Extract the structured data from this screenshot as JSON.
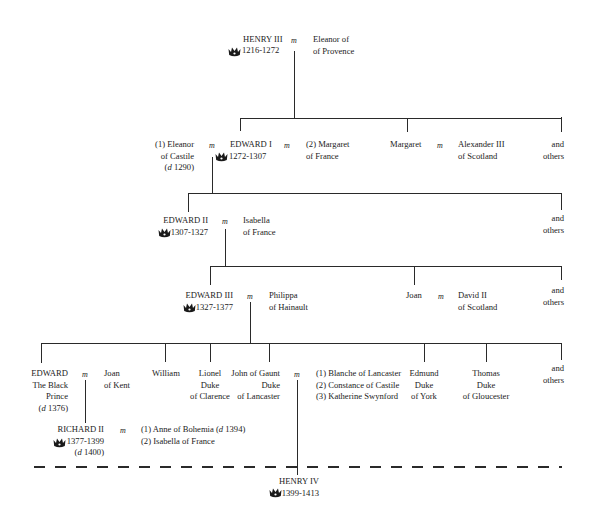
{
  "diagram": {
    "marriage_symbol": "m",
    "crown_icon": "crown-icon",
    "generation1": {
      "king": {
        "name": "HENRY III",
        "reign": "1216-1272"
      },
      "spouse": {
        "line1": "Eleanor of",
        "line2": "of Provence"
      }
    },
    "generation2": {
      "spouse1": {
        "line1": "(1) Eleanor",
        "line2": "of Castile",
        "line3_prefix": "d",
        "line3": "1290"
      },
      "king": {
        "name": "EDWARD I",
        "reign": "1272-1307"
      },
      "spouse2": {
        "line1": "(2) Margaret",
        "line2": "of France"
      },
      "sibling": {
        "name": "Margaret"
      },
      "sibling_spouse": {
        "line1": "Alexander III",
        "line2": "of Scotland"
      },
      "others": {
        "line1": "and",
        "line2": "others"
      }
    },
    "generation3": {
      "king": {
        "name": "EDWARD II",
        "reign": "1307-1327"
      },
      "spouse": {
        "line1": "Isabella",
        "line2": "of France"
      },
      "others": {
        "line1": "and",
        "line2": "others"
      }
    },
    "generation4": {
      "king": {
        "name": "EDWARD III",
        "reign": "1327-1377"
      },
      "spouse": {
        "line1": "Philippa",
        "line2": "of Hainault"
      },
      "sibling": {
        "name": "Joan"
      },
      "sibling_spouse": {
        "line1": "David II",
        "line2": "of Scotland"
      },
      "others": {
        "line1": "and",
        "line2": "others"
      }
    },
    "generation5": {
      "black_prince": {
        "line1": "EDWARD",
        "line2": "The Black",
        "line3": "Prince",
        "line4_prefix": "d",
        "line4": "1376"
      },
      "black_prince_spouse": {
        "line1": "Joan",
        "line2": "of Kent"
      },
      "william": {
        "name": "William"
      },
      "lionel": {
        "line1": "Lionel",
        "line2": "Duke",
        "line3": "of Clarence"
      },
      "john_of_gaunt": {
        "line1": "John of Gaunt",
        "line2": "Duke",
        "line3": "of Lancaster"
      },
      "gaunt_spouses": [
        "(1) Blanche of Lancaster",
        "(2) Constance of Castile",
        "(3) Katherine Swynford"
      ],
      "edmund": {
        "line1": "Edmund",
        "line2": "Duke",
        "line3": "of York"
      },
      "thomas": {
        "line1": "Thomas",
        "line2": "Duke",
        "line3": "of Gloucester"
      },
      "others": {
        "line1": "and",
        "line2": "others"
      }
    },
    "generation6": {
      "richard": {
        "name": "RICHARD II",
        "reign": "1377-1399",
        "death_prefix": "d",
        "death": "1400"
      },
      "richard_spouse1": {
        "text": "(1) Anne of Bohemia (",
        "prefix": "d",
        "year": "1394)"
      },
      "richard_spouse2": "(2) Isabella of France"
    },
    "generation7": {
      "king": {
        "name": "HENRY IV",
        "reign": "1399-1413"
      }
    }
  }
}
